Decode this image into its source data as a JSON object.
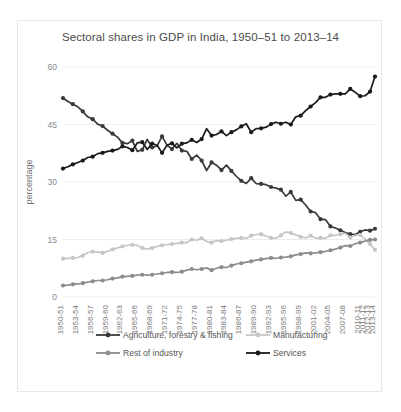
{
  "chart_data": {
    "type": "line",
    "title": "Sectoral shares in GDP in India, 1950–51 to 2013–14",
    "xlabel": "",
    "ylabel": "percentage",
    "ylim": [
      0,
      60
    ],
    "yticks": [
      0,
      15,
      30,
      45,
      60
    ],
    "grid": true,
    "legend_position": "bottom",
    "categories": [
      "1950-51",
      "1951-52",
      "1952-53",
      "1953-54",
      "1954-55",
      "1955-56",
      "1956-57",
      "1957-58",
      "1958-59",
      "1959-60",
      "1960-61",
      "1961-62",
      "1962-63",
      "1963-64",
      "1964-65",
      "1965-66",
      "1966-67",
      "1967-68",
      "1968-69",
      "1969-70",
      "1970-71",
      "1971-72",
      "1972-73",
      "1973-74",
      "1974-75",
      "1975-76",
      "1976-77",
      "1977-78",
      "1978-79",
      "1979-80",
      "1980-81",
      "1981-82",
      "1982-83",
      "1983-84",
      "1984-85",
      "1985-86",
      "1986-87",
      "1987-88",
      "1988-89",
      "1989-90",
      "1990-91",
      "1991-92",
      "1992-93",
      "1993-94",
      "1994-95",
      "1995-96",
      "1996-97",
      "1997-98",
      "1998-99",
      "1999-00",
      "2000-01",
      "2001-02",
      "2002-03",
      "2003-04",
      "2004-05",
      "2005-06",
      "2006-07",
      "2007-08",
      "2008-09",
      "2009-10",
      "2010-11",
      "2011-12",
      "2012-13",
      "2013-14"
    ],
    "xtick_labels": [
      "1950-51",
      "1953-54",
      "1956-57",
      "1959-60",
      "1962-63",
      "1965-66",
      "1968-69",
      "1971-72",
      "1974-75",
      "1977-78",
      "1980-81",
      "1983-84",
      "1986-87",
      "1989-90",
      "1992-93",
      "1995-96",
      "1998-99",
      "2001-02",
      "2004-05",
      "2007-08",
      "2010-11",
      "2011-12",
      "2012-13",
      "2013-14"
    ],
    "series": [
      {
        "name": "Agriculture, forestry & fishing",
        "color": "#3a3a3a",
        "values": [
          51.9,
          51.0,
          50.3,
          49.6,
          48.4,
          47.0,
          46.4,
          45.1,
          44.6,
          43.5,
          42.6,
          41.7,
          40.2,
          40.0,
          40.8,
          38.0,
          38.4,
          41.1,
          39.0,
          39.4,
          41.9,
          39.6,
          38.6,
          40.1,
          38.2,
          38.0,
          36.0,
          37.0,
          35.6,
          33.0,
          35.1,
          34.4,
          33.1,
          34.4,
          32.9,
          31.5,
          30.3,
          29.6,
          31.0,
          29.6,
          29.5,
          29.3,
          28.7,
          28.4,
          28.0,
          26.3,
          27.4,
          25.2,
          25.4,
          24.0,
          22.3,
          22.0,
          20.3,
          20.2,
          18.4,
          18.0,
          17.4,
          16.8,
          16.4,
          16.3,
          17.0,
          17.5,
          17.3,
          17.8
        ]
      },
      {
        "name": "Manufacturing",
        "color": "#c6c6c6",
        "values": [
          10.0,
          10.1,
          10.2,
          10.3,
          10.8,
          11.6,
          11.8,
          11.7,
          11.5,
          11.9,
          12.4,
          12.8,
          13.2,
          13.5,
          13.6,
          13.5,
          12.8,
          12.5,
          12.8,
          13.2,
          13.5,
          13.7,
          13.8,
          14.0,
          14.2,
          14.2,
          15.0,
          14.8,
          15.3,
          14.5,
          14.2,
          14.7,
          14.6,
          14.8,
          15.1,
          15.3,
          15.4,
          15.3,
          16.0,
          16.3,
          16.4,
          15.9,
          15.4,
          15.3,
          16.1,
          17.0,
          16.7,
          16.2,
          15.7,
          15.4,
          16.0,
          15.3,
          15.4,
          15.3,
          16.1,
          16.1,
          16.4,
          16.6,
          15.5,
          16.1,
          16.2,
          15.1,
          13.8,
          12.3
        ]
      },
      {
        "name": "Rest of industry",
        "color": "#8c8c8c",
        "values": [
          3.0,
          3.1,
          3.3,
          3.4,
          3.6,
          3.9,
          4.1,
          4.3,
          4.3,
          4.5,
          4.8,
          5.0,
          5.3,
          5.4,
          5.5,
          5.7,
          5.8,
          5.7,
          5.8,
          6.0,
          6.2,
          6.4,
          6.5,
          6.4,
          6.6,
          7.0,
          7.3,
          7.1,
          7.3,
          7.6,
          7.0,
          7.5,
          7.8,
          7.7,
          8.2,
          8.6,
          8.8,
          9.1,
          9.3,
          9.6,
          9.8,
          10.0,
          10.2,
          10.1,
          10.3,
          10.4,
          10.6,
          11.0,
          11.2,
          11.5,
          11.4,
          11.5,
          11.7,
          11.9,
          12.2,
          12.5,
          12.9,
          13.4,
          13.3,
          13.9,
          14.2,
          14.6,
          14.9,
          15.0
        ]
      },
      {
        "name": "Services",
        "color": "#1a1a1a",
        "values": [
          33.5,
          34.0,
          34.6,
          35.1,
          35.6,
          36.4,
          36.6,
          37.4,
          37.6,
          38.0,
          38.2,
          38.5,
          39.3,
          39.0,
          38.3,
          40.2,
          40.4,
          38.5,
          40.0,
          39.6,
          37.6,
          39.6,
          40.1,
          38.9,
          40.0,
          40.2,
          41.0,
          40.3,
          41.2,
          43.9,
          42.1,
          42.4,
          43.2,
          42.1,
          43.0,
          43.6,
          44.5,
          45.2,
          43.0,
          43.9,
          44.0,
          44.3,
          45.1,
          45.6,
          45.2,
          45.6,
          45.0,
          47.0,
          47.3,
          48.6,
          49.7,
          50.7,
          52.1,
          52.1,
          52.8,
          53.0,
          53.0,
          53.0,
          54.3,
          53.4,
          52.4,
          52.5,
          53.6,
          57.5
        ]
      }
    ]
  }
}
